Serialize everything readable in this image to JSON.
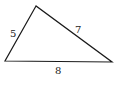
{
  "diagram": {
    "type": "triangle",
    "vertices": {
      "top": [
        36,
        6
      ],
      "left": [
        5,
        61
      ],
      "right": [
        112,
        62
      ]
    },
    "sides": [
      {
        "name": "left-side",
        "label": "5",
        "from": "left",
        "to": "top"
      },
      {
        "name": "right-side",
        "label": "7",
        "from": "top",
        "to": "right"
      },
      {
        "name": "bottom-side",
        "label": "8",
        "from": "left",
        "to": "right"
      }
    ],
    "stroke_color": "#1a1a1a",
    "label_color": "#222222",
    "background": "#ffffff"
  }
}
